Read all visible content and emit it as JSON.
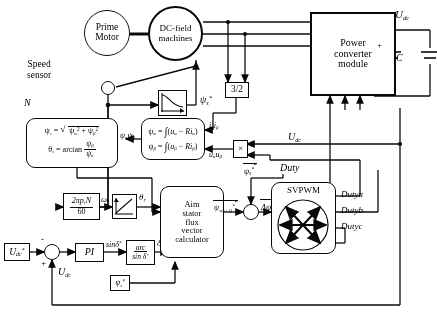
{
  "diagram": {
    "nodes": {
      "prime_motor": "Prime\nMotor",
      "dc_field_machines": "DC-field\nmachines",
      "power_converter": "Power\nconverter\nmodule",
      "svpwm": "SVPWM",
      "aim_calc": "Aim\nstator\nflux\nvector\ncalculator",
      "pi": "PI",
      "three_two": "3/2",
      "multiplier": "×",
      "arcsin_top": "arc",
      "arcsin_bottom": "sin δ*",
      "flux_cmd_small": "ψs*",
      "capacitor": "C"
    },
    "formulas": {
      "flux_magnitude": "ψs = √(ψα² + ψβ²)",
      "flux_angle_lhs": "θs = arctan",
      "flux_angle_num": "ψβ",
      "flux_angle_den": "ψα",
      "psi_alpha": "ψα = ∫(uα − Riα)",
      "psi_beta": "ψβ = ∫(uβ − Riβ)",
      "speed_gain_num": "2π pr N",
      "speed_gain_den": "60"
    },
    "labels": {
      "speed_sensor": "Speed\nsensor",
      "speed_sensor_l1": "Speed",
      "speed_sensor_l2": "sensor",
      "n_signal": "N",
      "udc_top": "Udc",
      "udc_mid": "Udc",
      "udc_feedback": "Udc",
      "udc_ref": "Udc*",
      "duty": "Duty",
      "dutya": "Dutya",
      "dutyb": "Dutyb",
      "dutyc": "Dutyc",
      "psi_s_star": "ψs*",
      "psi_ab": "ψα ψβ",
      "i_ab": "iα iβ",
      "u_ab": "uα uβ",
      "omega_r": "ωr",
      "theta_r": "θr",
      "sin_delta": "sin δ*",
      "delta_star": "δ*",
      "psi_vec_ref": "ψs*",
      "psi_vec_k1": "ψs*(k+1)",
      "delta_psi": "Δψ",
      "plus": "+",
      "minus": "-",
      "cap_plus": "+"
    }
  }
}
